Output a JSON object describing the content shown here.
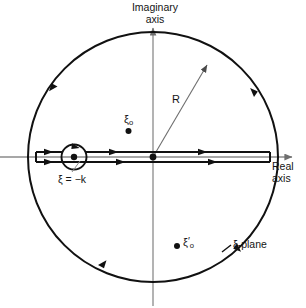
{
  "figure": {
    "plane_label": "ξ-plane",
    "axes": {
      "imaginary_label_line1": "Imaginary",
      "imaginary_label_line2": "axis",
      "real_label_line1": "Real",
      "real_label_line2": "axis"
    },
    "radius_label": "R",
    "pole_branch_label": "ξ = −k",
    "pole_upper": {
      "symbol": "ξ",
      "subscript": "o",
      "prime": ""
    },
    "pole_lower": {
      "symbol": "ξ",
      "subscript": "o",
      "prime": "′"
    },
    "colors": {
      "contour": "#111111",
      "axis": "#8a8a8a",
      "radius_line": "#6e6e6e",
      "leader": "#8a8a8a",
      "background": "#ffffff",
      "text": "#141414"
    },
    "geometry": {
      "center_x": 153,
      "center_y": 157,
      "radius": 125,
      "detour_center_x": 74,
      "detour_radius": 13,
      "cut_offset": 5
    }
  }
}
